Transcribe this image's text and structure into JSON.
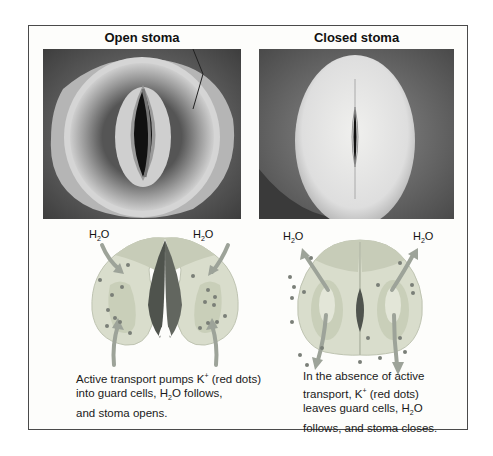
{
  "figure": {
    "panels": [
      {
        "id": "open",
        "title": "Open stoma",
        "photo": "SEM micrograph of open stoma with wide pore between guard cells",
        "h2o_labels": [
          "H2O",
          "H2O"
        ],
        "caption": {
          "line1_prefix": "Active transport pumps K",
          "line1_sup": "+",
          "line1_suffix": " (red dots)",
          "line2_prefix": "into guard cells, H",
          "line2_sub": "2",
          "line2_suffix": "O follows,",
          "line3": "and stoma opens."
        }
      },
      {
        "id": "closed",
        "title": "Closed stoma",
        "photo": "SEM micrograph of closed stoma with narrow slit pore",
        "h2o_labels": [
          "H2O",
          "H2O"
        ],
        "caption": {
          "line1": "In the absence of active",
          "line2_prefix": "transport, K",
          "line2_sup": "+",
          "line2_suffix": " (red dots)",
          "line3_prefix": "leaves guard cells, H",
          "line3_sub": "2",
          "line3_suffix": "O",
          "line4": "follows, and stoma closes."
        }
      }
    ],
    "h2o": {
      "base": "H",
      "sub": "2",
      "end": "O"
    },
    "colors": {
      "guard_cell_outer": "#d9ddcc",
      "guard_cell_inner": "#c3c8b3",
      "vacuole": "#e3e6d8",
      "pore": "#5a5e58",
      "k_dot": "#7a7f78",
      "arrow": "#9da399",
      "frame": "#4a4a4a"
    }
  }
}
